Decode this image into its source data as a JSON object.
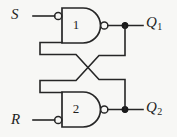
{
  "figure": {
    "background_color": "#f7f7f5",
    "line_color": "#262626"
  },
  "diagram": {
    "type": "logic-circuit",
    "gates": [
      {
        "id": "gate-1",
        "number": "1",
        "type": "nand",
        "inputs": [
          "S",
          "feedback-from-Q2"
        ],
        "output": "Q1"
      },
      {
        "id": "gate-2",
        "number": "2",
        "type": "nand",
        "inputs": [
          "feedback-from-Q1",
          "R"
        ],
        "output": "Q2"
      }
    ],
    "ports": {
      "set_input": "S",
      "reset_input": "R",
      "output_1_letter": "Q",
      "output_1_sub": "1",
      "output_2_letter": "Q",
      "output_2_sub": "2"
    }
  }
}
